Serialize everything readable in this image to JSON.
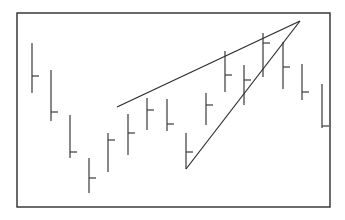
{
  "figure": {
    "title": "",
    "background_color": "#ffffff",
    "frame": {
      "x": 17,
      "y": 13,
      "width": 313,
      "height": 194,
      "stroke_color": "#2b2b2b",
      "stroke_width": 1.4
    }
  },
  "chart_data": {
    "type": "ohlc",
    "title": "",
    "subtitle": "",
    "xlabel": "",
    "ylabel": "",
    "grid": false,
    "legend": null,
    "axis_ticks_visible": false,
    "tick_labels": [],
    "bar_style": {
      "stroke_color": "#3a3a3a",
      "stroke_width": 1.2,
      "open_tick_side": "left",
      "open_tick_length": 7
    },
    "xlim": [
      0,
      17
    ],
    "ylim_pixels": [
      207,
      13
    ],
    "note": "Pixel y values: smaller y = higher price. Bars listed left to right.",
    "bars": [
      {
        "index": 1,
        "x": 32,
        "high_y": 43,
        "low_y": 93,
        "open_y": 76
      },
      {
        "index": 2,
        "x": 51,
        "high_y": 70,
        "low_y": 121,
        "open_y": 112
      },
      {
        "index": 3,
        "x": 70,
        "high_y": 115,
        "low_y": 158,
        "open_y": 152
      },
      {
        "index": 4,
        "x": 89,
        "high_y": 158,
        "low_y": 193,
        "open_y": 178
      },
      {
        "index": 5,
        "x": 108,
        "high_y": 133,
        "low_y": 172,
        "open_y": 140
      },
      {
        "index": 6,
        "x": 128,
        "high_y": 114,
        "low_y": 155,
        "open_y": 133
      },
      {
        "index": 7,
        "x": 147,
        "high_y": 98,
        "low_y": 130,
        "open_y": 110
      },
      {
        "index": 8,
        "x": 167,
        "high_y": 99,
        "low_y": 131,
        "open_y": 124
      },
      {
        "index": 9,
        "x": 186,
        "high_y": 133,
        "low_y": 169,
        "open_y": 152
      },
      {
        "index": 10,
        "x": 206,
        "high_y": 93,
        "low_y": 125,
        "open_y": 105
      },
      {
        "index": 11,
        "x": 225,
        "high_y": 51,
        "low_y": 92,
        "open_y": 75
      },
      {
        "index": 12,
        "x": 244,
        "high_y": 65,
        "low_y": 105,
        "open_y": 80
      },
      {
        "index": 13,
        "x": 263,
        "high_y": 33,
        "low_y": 77,
        "open_y": 43
      },
      {
        "index": 14,
        "x": 283,
        "high_y": 42,
        "low_y": 89,
        "open_y": 67
      },
      {
        "index": 15,
        "x": 302,
        "high_y": 64,
        "low_y": 100,
        "open_y": 92
      },
      {
        "index": 16,
        "x": 322,
        "high_y": 84,
        "low_y": 128,
        "open_y": 126
      }
    ],
    "trendlines": [
      {
        "name": "upper-resistance-trendline",
        "x1": 117,
        "y1": 107,
        "x2": 300,
        "y2": 21,
        "stroke_color": "#2b2b2b",
        "stroke_width": 1.2
      },
      {
        "name": "lower-support-trendline",
        "x1": 186,
        "y1": 169,
        "x2": 300,
        "y2": 21,
        "stroke_color": "#2b2b2b",
        "stroke_width": 1.2
      }
    ],
    "pattern": {
      "name": "rising-wedge",
      "apex_x": 300,
      "apex_y": 21
    }
  }
}
